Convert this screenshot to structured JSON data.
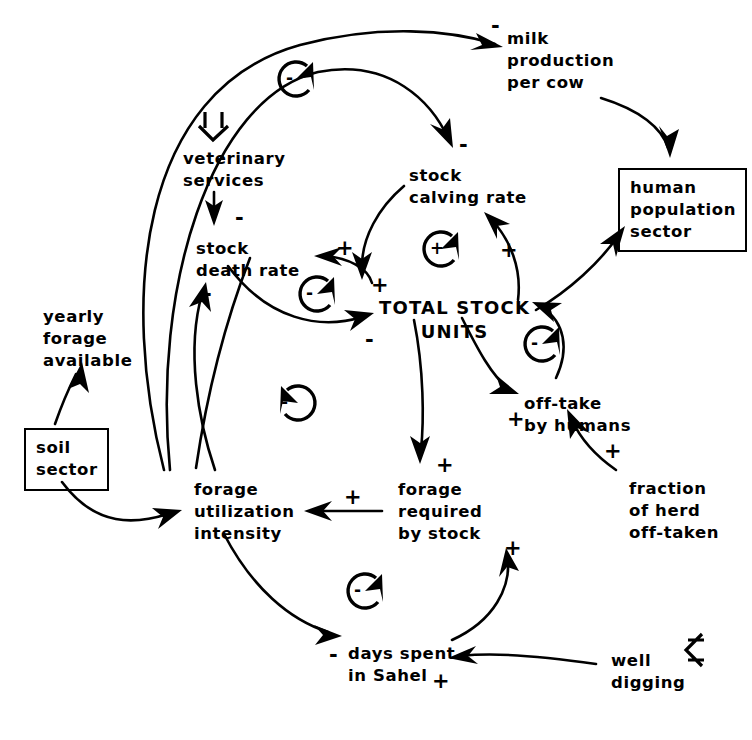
{
  "diagram": {
    "type": "causal-loop-diagram",
    "background": "#ffffff",
    "ink": "#000000",
    "nodes": [
      {
        "id": "milk",
        "label": "milk\nproduction\nper cow",
        "boxed": false,
        "x": 507,
        "y": 28
      },
      {
        "id": "vet",
        "label": "veterinary\nservices",
        "boxed": false,
        "x": 183,
        "y": 148
      },
      {
        "id": "calving",
        "label": "stock\ncalving rate",
        "boxed": false,
        "x": 409,
        "y": 165
      },
      {
        "id": "humanpop",
        "label": "human\npopulation\nsector",
        "boxed": true,
        "x": 618,
        "y": 168
      },
      {
        "id": "death",
        "label": "stock\ndeath rate",
        "boxed": false,
        "x": 196,
        "y": 238
      },
      {
        "id": "forage_avl",
        "label": "yearly\nforage\navailable",
        "boxed": false,
        "x": 43,
        "y": 306
      },
      {
        "id": "tsu",
        "label": "TOTAL STOCK\nUNITS",
        "boxed": false,
        "x": 379,
        "y": 296,
        "caps": true
      },
      {
        "id": "offtake",
        "label": "off-take\nby humans",
        "boxed": false,
        "x": 524,
        "y": 393
      },
      {
        "id": "soil",
        "label": "soil\nsector",
        "boxed": true,
        "x": 24,
        "y": 428
      },
      {
        "id": "fraction",
        "label": "fraction\nof herd\noff-taken",
        "boxed": false,
        "x": 629,
        "y": 478
      },
      {
        "id": "fui",
        "label": "forage\nutilization\nintensity",
        "boxed": false,
        "x": 194,
        "y": 479
      },
      {
        "id": "required",
        "label": "forage\nrequired\nby stock",
        "boxed": false,
        "x": 398,
        "y": 479
      },
      {
        "id": "days",
        "label": "days spent\nin Sahel",
        "boxed": false,
        "x": 348,
        "y": 643
      },
      {
        "id": "well",
        "label": "well\ndigging",
        "boxed": false,
        "x": 611,
        "y": 650
      }
    ],
    "links": [
      {
        "from": "fui",
        "to": "milk",
        "sign": "-"
      },
      {
        "from": "fui",
        "to": "calving",
        "sign": "-"
      },
      {
        "from": "milk",
        "to": "humanpop",
        "sign": ""
      },
      {
        "from": "vet",
        "to": "death",
        "sign": "-"
      },
      {
        "from": "calving",
        "to": "tsu",
        "sign": "+"
      },
      {
        "from": "tsu",
        "to": "calving",
        "sign": "+"
      },
      {
        "from": "tsu",
        "to": "death",
        "sign": "+"
      },
      {
        "from": "death",
        "to": "tsu",
        "sign": "-"
      },
      {
        "from": "fui",
        "to": "death",
        "sign": "-"
      },
      {
        "from": "tsu",
        "to": "humanpop",
        "sign": ""
      },
      {
        "from": "offtake",
        "to": "tsu",
        "sign": "-"
      },
      {
        "from": "tsu",
        "to": "offtake",
        "sign": "+"
      },
      {
        "from": "fraction",
        "to": "offtake",
        "sign": "+"
      },
      {
        "from": "tsu",
        "to": "required",
        "sign": "+"
      },
      {
        "from": "required",
        "to": "fui",
        "sign": "+"
      },
      {
        "from": "days",
        "to": "required",
        "sign": "+"
      },
      {
        "from": "fui",
        "to": "days",
        "sign": "-"
      },
      {
        "from": "well",
        "to": "days",
        "sign": "+"
      },
      {
        "from": "soil",
        "to": "forage_avl",
        "sign": ""
      },
      {
        "from": "soil",
        "to": "fui",
        "sign": ""
      }
    ],
    "loop_markers": [
      {
        "id": "loop-top",
        "polarity": "-",
        "x": 290,
        "y": 76,
        "direction": "clockwise"
      },
      {
        "id": "loop-calving",
        "polarity": "+",
        "x": 436,
        "y": 246,
        "direction": "clockwise"
      },
      {
        "id": "loop-death",
        "polarity": "-",
        "x": 311,
        "y": 291,
        "direction": "clockwise"
      },
      {
        "id": "loop-offtake",
        "polarity": "-",
        "x": 536,
        "y": 341,
        "direction": "clockwise"
      },
      {
        "id": "loop-mid-left",
        "polarity": "-",
        "x": 287,
        "y": 400,
        "direction": "counterclockwise"
      },
      {
        "id": "loop-bottom",
        "polarity": "-",
        "x": 359,
        "y": 588,
        "direction": "clockwise"
      }
    ],
    "exogenous_markers": [
      {
        "id": "vet-policy-arrow",
        "glyph": "hollow-arrow-down",
        "x": 213,
        "y": 115,
        "target": "vet"
      },
      {
        "id": "well-policy-arrow",
        "glyph": "hollow-arrow-left",
        "x": 690,
        "y": 648,
        "target": "well"
      }
    ],
    "link_signs": [
      {
        "id": "sign-milk-in",
        "text": "-",
        "x": 491,
        "y": 16
      },
      {
        "id": "sign-calving-in",
        "text": "-",
        "x": 459,
        "y": 135
      },
      {
        "id": "sign-vet-death",
        "text": "-",
        "x": 235,
        "y": 208
      },
      {
        "id": "sign-death-plus",
        "text": "+",
        "x": 336,
        "y": 238
      },
      {
        "id": "sign-calving-plus",
        "text": "+",
        "x": 500,
        "y": 240
      },
      {
        "id": "sign-tsu-calving",
        "text": "+",
        "x": 371,
        "y": 275
      },
      {
        "id": "sign-tsu-death",
        "text": "-",
        "x": 203,
        "y": 284
      },
      {
        "id": "sign-humanpop-in",
        "text": "-",
        "x": 548,
        "y": 294
      },
      {
        "id": "sign-tsu-offtake",
        "text": "-",
        "x": 365,
        "y": 330
      },
      {
        "id": "sign-offtake-plus",
        "text": "+",
        "x": 507,
        "y": 409
      },
      {
        "id": "sign-fraction-in",
        "text": "+",
        "x": 604,
        "y": 441
      },
      {
        "id": "sign-required-in",
        "text": "+",
        "x": 436,
        "y": 455
      },
      {
        "id": "sign-fui-in",
        "text": "+",
        "x": 344,
        "y": 487
      },
      {
        "id": "sign-days-req",
        "text": "+",
        "x": 504,
        "y": 538
      },
      {
        "id": "sign-days-in",
        "text": "-",
        "x": 329,
        "y": 645
      },
      {
        "id": "sign-well-days",
        "text": "+",
        "x": 432,
        "y": 671
      }
    ]
  }
}
